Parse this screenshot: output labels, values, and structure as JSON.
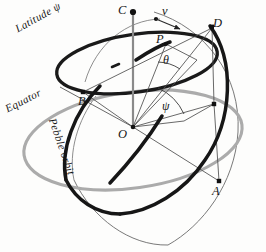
{
  "figure": {
    "background_color": "#fdfdfc",
    "width": 266,
    "height": 252
  },
  "colors": {
    "ink": "#151515",
    "thin_line": "#4a4a4a",
    "equator_gray": "#a8a8a8",
    "sphere_outline": "#555555",
    "heavy": "#1a1a1a"
  },
  "points": {
    "C": "C",
    "v": "v",
    "D": "D",
    "P": "P",
    "B": "B",
    "O": "O",
    "A": "A"
  },
  "angles": {
    "theta": "θ",
    "psi": "ψ"
  },
  "curve_labels": {
    "latitude": "Latitude ψ",
    "equator": "Equator",
    "pebble_orbit": "Pebble orbit"
  },
  "icons": {
    "vector_arrow": "velocity-arrow-icon",
    "axis": "polar-axis-icon"
  }
}
